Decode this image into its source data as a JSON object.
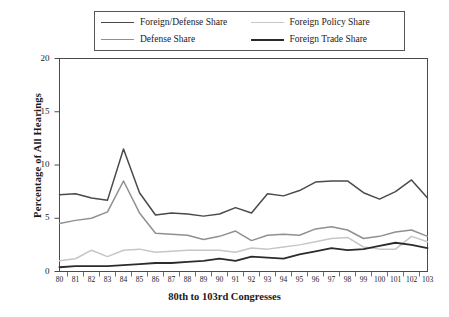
{
  "chart_data": {
    "type": "line",
    "title": "",
    "xlabel": "80th to 103rd Congresses",
    "ylabel": "Percentage of All Hearings",
    "categories": [
      "80",
      "81",
      "82",
      "83",
      "84",
      "85",
      "86",
      "87",
      "88",
      "89",
      "90",
      "91",
      "92",
      "93",
      "94",
      "95",
      "96",
      "97",
      "98",
      "99",
      "100",
      "101",
      "102",
      "103"
    ],
    "xlim": [
      80,
      103
    ],
    "ylim": [
      0,
      20
    ],
    "yticks": [
      0,
      5,
      10,
      15,
      20
    ],
    "grid": false,
    "legend_position": "top-outside",
    "series": [
      {
        "name": "Foreign/Defense Share",
        "color": "#4a4a4a",
        "width": 1.5,
        "values": [
          7.2,
          7.3,
          6.9,
          6.7,
          11.5,
          7.4,
          5.3,
          5.5,
          5.4,
          5.2,
          5.4,
          6.0,
          5.5,
          7.3,
          7.1,
          7.6,
          8.4,
          8.5,
          8.5,
          7.4,
          6.8,
          7.5,
          8.6,
          6.9
        ]
      },
      {
        "name": "Defense Share",
        "color": "#909090",
        "width": 1.5,
        "values": [
          4.5,
          4.8,
          5.0,
          5.6,
          8.5,
          5.5,
          3.6,
          3.5,
          3.4,
          3.0,
          3.3,
          3.8,
          2.9,
          3.4,
          3.5,
          3.4,
          4.0,
          4.2,
          3.9,
          3.1,
          3.3,
          3.7,
          3.9,
          3.3
        ]
      },
      {
        "name": "Foreign Policy Share",
        "color": "#c6c6c6",
        "width": 1.5,
        "values": [
          1.0,
          1.2,
          2.0,
          1.4,
          2.0,
          2.1,
          1.8,
          1.9,
          2.0,
          2.0,
          2.0,
          1.8,
          2.2,
          2.1,
          2.3,
          2.5,
          2.8,
          3.1,
          3.2,
          2.3,
          2.1,
          2.1,
          3.3,
          2.8
        ]
      },
      {
        "name": "Foreign Trade Share",
        "color": "#2b2b2b",
        "width": 1.8,
        "values": [
          0.4,
          0.5,
          0.5,
          0.5,
          0.6,
          0.7,
          0.8,
          0.8,
          0.9,
          1.0,
          1.2,
          1.0,
          1.4,
          1.3,
          1.2,
          1.6,
          1.9,
          2.2,
          2.0,
          2.1,
          2.4,
          2.7,
          2.5,
          2.2
        ]
      }
    ]
  },
  "legend": {
    "entries": [
      {
        "label": "Foreign/Defense Share",
        "color": "#4a4a4a",
        "width": 1.6
      },
      {
        "label": "Foreign Policy Share",
        "color": "#c6c6c6",
        "width": 1.6
      },
      {
        "label": "Defense Share",
        "color": "#909090",
        "width": 1.6
      },
      {
        "label": "Foreign Trade Share",
        "color": "#2b2b2b",
        "width": 2.0
      }
    ]
  },
  "axes": {
    "y_label": "Percentage of All Hearings",
    "x_label": "80th to 103rd Congresses",
    "y_ticks": [
      "0",
      "5",
      "10",
      "15",
      "20"
    ],
    "x_ticks": [
      "80",
      "81",
      "82",
      "83",
      "84",
      "85",
      "86",
      "87",
      "88",
      "89",
      "90",
      "91",
      "92",
      "93",
      "94",
      "95",
      "96",
      "97",
      "98",
      "99",
      "100",
      "101",
      "102",
      "103"
    ]
  }
}
